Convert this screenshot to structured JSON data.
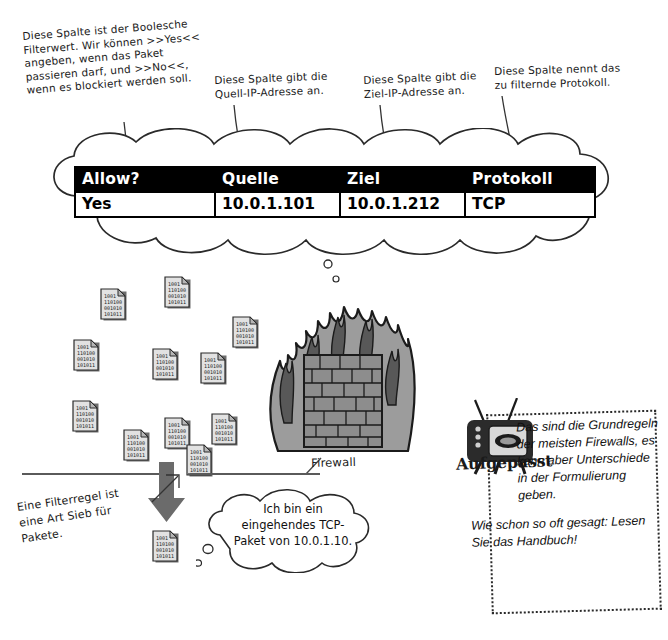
{
  "annotations": {
    "allow_column": "Diese Spalte ist der Boolesche\nFilterwert. Wir können >>Yes<<\nangeben, wenn das Paket\npassieren darf, und >>No<<,\nwenn es blockiert werden soll.",
    "source_column": "Diese Spalte gibt die\nQuell-IP-Adresse an.",
    "destination_column": "Diese Spalte gibt die\nZiel-IP-Adresse an.",
    "protocol_column": "Diese Spalte nennt das\nzu filternde Protokoll.",
    "filter_rule": "Eine Filterregel ist\neine Art Sieb für\nPakete.",
    "firewall_label": "Firewall"
  },
  "rule_table": {
    "headers": [
      "Allow?",
      "Quelle",
      "Ziel",
      "Protokoll"
    ],
    "rows": [
      [
        "Yes",
        "10.0.1.101",
        "10.0.1.212",
        "TCP"
      ]
    ]
  },
  "packet_bubble": {
    "text": "Ich bin ein\neingehendes TCP-\nPaket von 10.0.1.10."
  },
  "watch_out": {
    "caption": "Aufgepasst",
    "paragraph_1": "Das sind die Grundregeln der meisten Firewalls, es kann aber Unterschiede in der Formulierung geben.",
    "paragraph_2": "Wie schon so oft gesagt: Lesen Sie das Handbuch!"
  },
  "packets": {
    "binary_lines": [
      "1001",
      "110100",
      "001010",
      "101011"
    ],
    "count_above_firewall": 11,
    "count_below_arrow": 1
  },
  "colors": {
    "table_header_bg": "#000000",
    "table_header_fg": "#ffffff",
    "ink": "#1a1a1a",
    "flame_dark": "#4a4a4a",
    "flame_mid": "#8c8c8c",
    "brick": "#8a8a8a",
    "arrow_grey": "#6b6b6b"
  }
}
